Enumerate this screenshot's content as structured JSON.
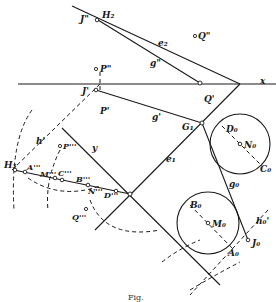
{
  "figure": {
    "caption": "Fig.",
    "labels": {
      "J2": "J\"",
      "H2": "H₂",
      "e2": "e₂",
      "Q2": "Q\"",
      "g2": "g\"",
      "P2": "P\"",
      "x_axis": "x",
      "J1": "J'",
      "Q1": "Q'",
      "P1": "P'",
      "g1": "g'",
      "G1": "G₁",
      "D0": "D₀",
      "N0": "N₀",
      "C0": "C₀",
      "h1": "h'",
      "P3": "P'''",
      "y_axis": "y",
      "H3": "H₃",
      "A3": "A'''",
      "M3": "M'''",
      "C3": "C'''",
      "B3": "B'''",
      "N3": "N'''",
      "D3": "D'''",
      "Q3": "Q'''",
      "e1": "e₁",
      "g0": "g₀",
      "B0": "B₀",
      "M0": "M₀",
      "A0": "A₀",
      "J0": "J₀",
      "h0": "h₀'"
    }
  }
}
